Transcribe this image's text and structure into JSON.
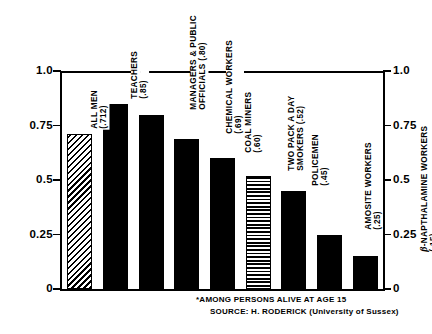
{
  "chart_data": {
    "type": "bar",
    "title": "",
    "subtitle": "",
    "xlabel": "",
    "ylabel": "",
    "ylim": [
      0,
      1.0
    ],
    "grid": false,
    "legend": "none",
    "axis_ticks": [
      "1.0",
      "0.75",
      "0.5",
      "0.25",
      "0"
    ],
    "axis_tick_values": [
      1.0,
      0.75,
      0.5,
      0.25,
      0
    ],
    "left_axis_labels": [
      "1.0",
      "0.75",
      "0.5",
      "0.25",
      "0"
    ],
    "right_axis_labels": [
      "1.0",
      "0.75",
      "0.5",
      "0.25",
      "0"
    ],
    "categories": [
      "ALL MEN",
      "TEACHERS",
      "MANAGERS & PUBLIC OFFICIALS",
      "CHEMICAL WORKERS",
      "COAL MINERS",
      "TWO PACK A DAY SMOKERS",
      "POLICEMEN",
      "AMOSITE WORKERS",
      "β-NAPTHALAMINE WORKERS"
    ],
    "values": [
      0.712,
      0.85,
      0.8,
      0.69,
      0.6,
      0.52,
      0.45,
      0.25,
      0.15
    ],
    "value_labels": [
      "(.712)",
      "(.85)",
      "(.80)",
      "(.69)",
      "(.60)",
      "(.52)",
      "(.45)",
      "(.25)",
      "(.15)"
    ],
    "bars": [
      {
        "name": "all-men",
        "label_lines": [
          "ALL MEN",
          "(.712)"
        ],
        "value": 0.712,
        "fill": "hatch-diag",
        "two_line": true
      },
      {
        "name": "teachers",
        "label_lines": [
          "TEACHERS",
          "(.85)"
        ],
        "value": 0.85,
        "fill": "solid",
        "two_line": true
      },
      {
        "name": "managers",
        "label_lines": [
          "MANAGERS & PUBLIC",
          "OFFICIALS (.80)"
        ],
        "value": 0.8,
        "fill": "solid",
        "two_line": true
      },
      {
        "name": "chemical-workers",
        "label_lines": [
          "CHEMICAL WORKERS",
          "(.69)"
        ],
        "value": 0.69,
        "fill": "solid",
        "two_line": true
      },
      {
        "name": "coal-miners",
        "label_lines": [
          "COAL MINERS",
          "(.60)"
        ],
        "value": 0.6,
        "fill": "solid",
        "two_line": true
      },
      {
        "name": "smokers",
        "label_lines": [
          "TWO PACK A DAY",
          "SMOKERS (.52)"
        ],
        "value": 0.52,
        "fill": "hatch-horiz",
        "two_line": true
      },
      {
        "name": "policemen",
        "label_lines": [
          "POLICEMEN",
          "(.45)"
        ],
        "value": 0.45,
        "fill": "solid",
        "two_line": true
      },
      {
        "name": "amosite-workers",
        "label_lines": [
          "AMOSITE WORKERS",
          "(.25)"
        ],
        "value": 0.25,
        "fill": "solid",
        "two_line": true
      },
      {
        "name": "naphthalamine-workers",
        "label_lines": [
          "β-NAPTHALAMINE WORKERS",
          "(.15)"
        ],
        "value": 0.15,
        "fill": "solid",
        "two_line": true,
        "beta_prefix": true
      }
    ],
    "annotations": [
      "*AMONG PERSONS ALIVE AT AGE 15",
      "SOURCE:  H. RODERICK (University of Sussex)"
    ]
  },
  "footnotes": {
    "note": "*AMONG PERSONS ALIVE AT AGE 15",
    "source": "SOURCE:  H. RODERICK (University of Sussex)"
  },
  "colors": {
    "ink": "#000000",
    "background": "#ffffff"
  }
}
